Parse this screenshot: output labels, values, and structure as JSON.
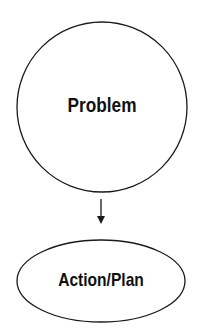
{
  "diagram": {
    "nodes": [
      {
        "id": "problem",
        "label": "Problem",
        "shape": "circle"
      },
      {
        "id": "action",
        "label": "Action/Plan",
        "shape": "ellipse"
      }
    ],
    "edges": [
      {
        "from": "problem",
        "to": "action",
        "type": "arrow"
      }
    ],
    "colors": {
      "stroke": "#1a1a1a",
      "text": "#111111",
      "background": "#ffffff"
    }
  }
}
